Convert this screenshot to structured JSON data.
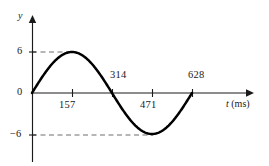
{
  "figure": {
    "background_color": "#ffffff",
    "curve_color": "#000000",
    "axis_color": "#1a1a1a",
    "guide_color": "#6f6f6f"
  },
  "axes": {
    "y_axis_name": "y",
    "x_axis_name": "t",
    "x_axis_unit": "(ms)",
    "x_axis_label_full": "t (ms)"
  },
  "y_labels": {
    "positive_peak": "6",
    "origin": "0",
    "negative_peak": "−6"
  },
  "x_labels": {
    "quarter": "157",
    "half": "314",
    "three_quarter": "471",
    "full": "628"
  },
  "chart_data": {
    "type": "line",
    "title": "",
    "subtitle": "",
    "xlabel": "t (ms)",
    "ylabel": "y",
    "grid": false,
    "legend": null,
    "legend_position": "none",
    "xlim": [
      0,
      700
    ],
    "ylim": [
      -8,
      8
    ],
    "xticks": [
      157,
      314,
      471,
      628
    ],
    "xtick_labels": [
      "157",
      "314",
      "471",
      "628"
    ],
    "xtick_label_side": [
      "below",
      "above",
      "below",
      "above"
    ],
    "yticks": [
      -6,
      0,
      6
    ],
    "ytick_labels": [
      "−6",
      "0",
      "6"
    ],
    "amplitude": 6,
    "period_ms": 628,
    "zero_crossings": [
      0,
      314,
      628
    ],
    "peak": {
      "x": 157,
      "y": 6
    },
    "trough": {
      "x": 471,
      "y": -6
    },
    "annotations": [
      {
        "type": "dashed-guide",
        "y": 6,
        "from_x": 0,
        "to_x": 157
      },
      {
        "type": "dashed-guide",
        "y": -6,
        "from_x": 0,
        "to_x": 471
      }
    ],
    "series": [
      {
        "name": "y(t)",
        "equation": "y = 6 sin(2πt/628)",
        "x": [
          0,
          39,
          79,
          118,
          157,
          196,
          236,
          275,
          314,
          353,
          393,
          432,
          471,
          510,
          550,
          589,
          628
        ],
        "values": [
          0,
          2.3,
          4.24,
          5.54,
          6.0,
          5.54,
          4.24,
          2.3,
          0,
          -2.3,
          -4.24,
          -5.54,
          -6.0,
          -5.54,
          -4.24,
          -2.3,
          0
        ]
      }
    ]
  }
}
